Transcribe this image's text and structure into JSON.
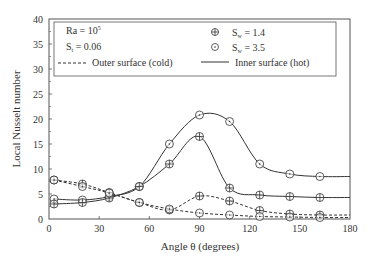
{
  "chart_data": {
    "type": "line",
    "title": "",
    "xlabel": "Angle θ (degrees)",
    "ylabel": "Local Nusselt number",
    "xlim": [
      0,
      180
    ],
    "ylim": [
      0,
      40
    ],
    "xticks": [
      0,
      30,
      60,
      90,
      120,
      150,
      180
    ],
    "yticks": [
      0,
      5,
      10,
      15,
      20,
      25,
      30,
      35,
      40
    ],
    "grid": false,
    "annotations": [
      "Ra = 10^5",
      "S_t = 0.06"
    ],
    "legend": {
      "position": "top",
      "entries": [
        "S_w = 1.4",
        "S_w = 3.5",
        "Outer surface (cold)",
        "Inner surface (hot)"
      ]
    },
    "x": [
      3,
      20,
      36,
      54,
      72,
      90,
      108,
      126,
      144,
      162
    ],
    "series": [
      {
        "name": "S_w = 3.5, Inner surface (hot)",
        "marker": "circle-dot",
        "line": "solid",
        "values": [
          4.0,
          3.8,
          4.5,
          6.5,
          15.0,
          20.8,
          19.5,
          11.0,
          9.0,
          8.5
        ]
      },
      {
        "name": "S_w = 1.4, Inner surface (hot)",
        "marker": "circle-plus",
        "line": "solid",
        "values": [
          3.0,
          3.3,
          4.2,
          6.5,
          11.0,
          16.5,
          6.2,
          4.8,
          4.5,
          4.3
        ]
      },
      {
        "name": "S_w = 1.4, Outer surface (cold)",
        "marker": "circle-plus",
        "line": "dashed",
        "values": [
          7.8,
          7.0,
          5.3,
          3.3,
          1.8,
          4.6,
          3.6,
          1.7,
          1.0,
          0.8
        ]
      },
      {
        "name": "S_w = 3.5, Outer surface (cold)",
        "marker": "circle-dot",
        "line": "dashed",
        "values": [
          7.8,
          6.5,
          5.2,
          3.3,
          2.0,
          1.2,
          0.8,
          0.5,
          0.4,
          0.3
        ]
      }
    ]
  },
  "labels": {
    "ra": "Ra = 10",
    "ra_exp": "5",
    "st": "S",
    "st_sub": "t",
    "st_val": " = 0.06",
    "outer": "Outer surface (cold)",
    "sw14": "S",
    "sw_sub": "w",
    "sw14_val": " = 1.4",
    "sw35_val": " = 3.5",
    "inner": "Inner surface (hot)",
    "xlabel": "Angle θ (degrees)",
    "ylabel": "Local Nusselt number"
  }
}
